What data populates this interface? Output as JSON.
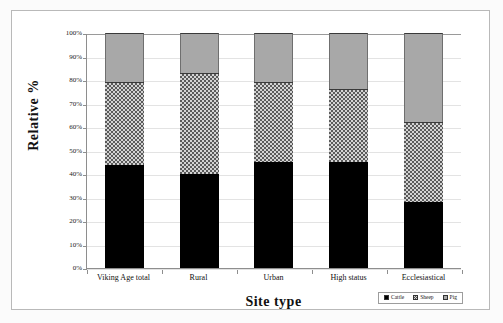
{
  "chart_data": {
    "type": "bar",
    "stacked": true,
    "normalized": true,
    "title": "",
    "xlabel": "Site type",
    "ylabel": "Relative %",
    "ylim": [
      0,
      100
    ],
    "ytick_step": 10,
    "grid": true,
    "legend_position": "bottom-right",
    "categories": [
      "Viking Age total",
      "Rural",
      "Urban",
      "High status",
      "Ecclesiastical"
    ],
    "yticks": [
      "0%",
      "10%",
      "20%",
      "30%",
      "40%",
      "50%",
      "60%",
      "70%",
      "80%",
      "90%",
      "100%"
    ],
    "series": [
      {
        "name": "Cattle",
        "fill": "solid-black",
        "color": "#000000",
        "values": [
          44,
          40,
          45,
          45,
          28
        ]
      },
      {
        "name": "Sheep",
        "fill": "checkered",
        "color": "#d3d3d3",
        "values": [
          35,
          43,
          34,
          31,
          34
        ]
      },
      {
        "name": "Pig",
        "fill": "solid-gray",
        "color": "#a8a8a8",
        "values": [
          21,
          17,
          21,
          24,
          38
        ]
      }
    ]
  }
}
